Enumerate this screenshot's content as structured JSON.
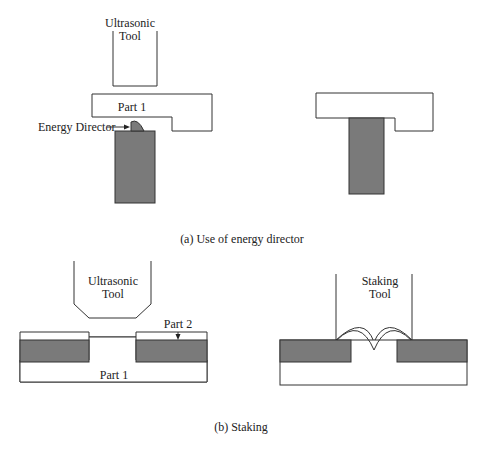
{
  "figure_a": {
    "tool_label_line1": "Ultrasonic",
    "tool_label_line2": "Tool",
    "part1_label": "Part 1",
    "energy_director_label": "Energy Director",
    "caption": "(a) Use of energy director"
  },
  "figure_b": {
    "ultrasonic_tool_line1": "Ultrasonic",
    "ultrasonic_tool_line2": "Tool",
    "part2_label": "Part 2",
    "part1_label": "Part 1",
    "staking_tool_line1": "Staking",
    "staking_tool_line2": "Tool",
    "caption": "(b) Staking"
  },
  "colors": {
    "outline": "#333333",
    "shaded_part": "#7a7a7a"
  }
}
